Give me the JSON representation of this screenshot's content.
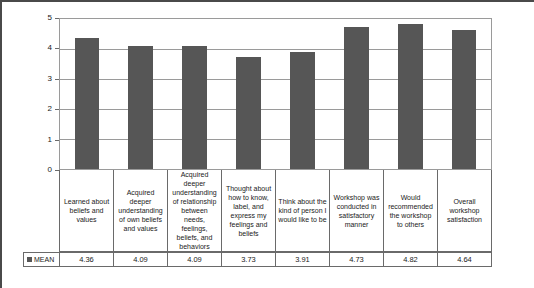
{
  "chart_data": {
    "type": "bar",
    "title": "",
    "xlabel": "",
    "ylabel": "",
    "ylim": [
      0,
      5
    ],
    "yticks": [
      "5",
      "4",
      "3",
      "2",
      "1",
      "0"
    ],
    "grid": true,
    "legend_position": "bottom-left",
    "series_name": "MEAN",
    "series_color": "#565656",
    "categories": [
      "Learned about beliefs and values",
      "Acquired deeper understanding of own beliefs and values",
      "Acquired deeper understanding of relationship between needs, feelings, beliefs, and behaviors",
      "Thought about how to know, label, and express my feelings and beliefs",
      "Think about the kind of person I would like to be",
      "Workshop was conducted in satisfactory manner",
      "Would recommended the workshop to others",
      "Overall workshop satisfaction"
    ],
    "values": [
      4.36,
      4.09,
      4.09,
      3.73,
      3.91,
      4.73,
      4.82,
      4.64
    ],
    "value_labels": [
      "4.36",
      "4.09",
      "4.09",
      "3.73",
      "3.91",
      "4.73",
      "4.82",
      "4.64"
    ]
  }
}
